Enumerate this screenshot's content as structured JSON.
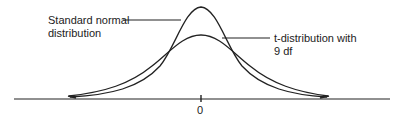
{
  "diagram": {
    "labels": {
      "normal_line1": "Standard normal",
      "normal_line2": "distribution",
      "t_line1": "t-distribution with",
      "t_line2": "9 df",
      "axis_zero": "0"
    },
    "colors": {
      "stroke": "#222222",
      "background": "#ffffff"
    },
    "curves": [
      {
        "name": "Standard normal distribution",
        "peak": "taller, narrower"
      },
      {
        "name": "t-distribution with 9 df",
        "peak": "lower, heavier tails"
      }
    ],
    "axis": {
      "center_tick": "0"
    }
  }
}
